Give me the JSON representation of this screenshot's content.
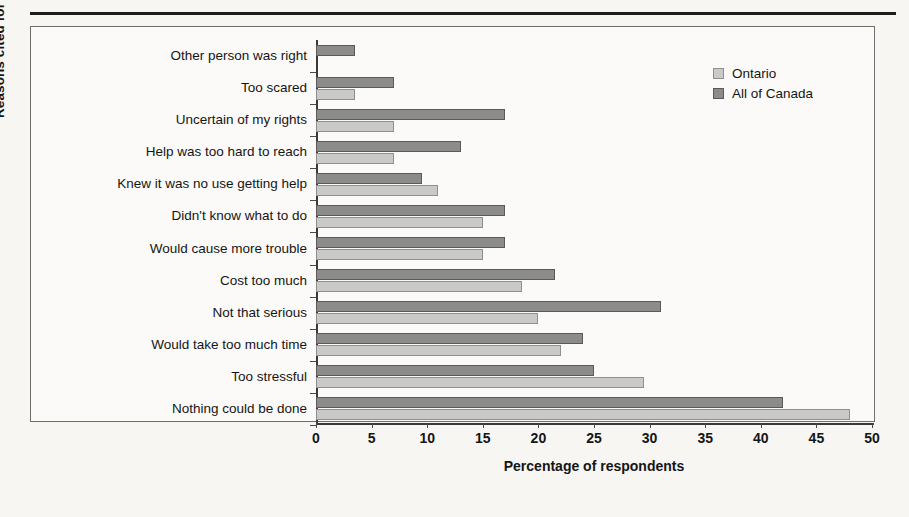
{
  "figure": {
    "y_axis_title": "Reasons cited for inaction",
    "x_axis_title": "Percentage of respondents"
  },
  "legend": {
    "position": "top-right",
    "entries": [
      {
        "label": "Ontario",
        "swatch": "light-gray-swatch-icon",
        "color": "#c9c9c7"
      },
      {
        "label": "All of Canada",
        "swatch": "dark-gray-swatch-icon",
        "color": "#8b8b8b"
      }
    ]
  },
  "chart_data": {
    "type": "bar",
    "orientation": "horizontal",
    "title": "",
    "xlabel": "Percentage of respondents",
    "ylabel": "Reasons cited for inaction",
    "xlim": [
      0,
      50
    ],
    "xticks": [
      0,
      5,
      10,
      15,
      20,
      25,
      30,
      35,
      40,
      45,
      50
    ],
    "xtick_labels": [
      "0",
      "5",
      "10",
      "15",
      "20",
      "25",
      "30",
      "35",
      "40",
      "45",
      "50"
    ],
    "grid": false,
    "legend_position": "top-right",
    "categories": [
      "Other person was right",
      "Too scared",
      "Uncertain of my rights",
      "Help was too hard to reach",
      "Knew it was no use getting help",
      "Didn't know what to do",
      "Would cause more trouble",
      "Cost too much",
      "Not that serious",
      "Would take too much time",
      "Too stressful",
      "Nothing could be done"
    ],
    "series": [
      {
        "name": "Ontario",
        "color": "#c9c9c7",
        "values": [
          0,
          3.5,
          7,
          7,
          11,
          15,
          15,
          18.5,
          20,
          22,
          29.5,
          48
        ]
      },
      {
        "name": "All of Canada",
        "color": "#8b8b8b",
        "values": [
          3.5,
          7,
          17,
          13,
          9.5,
          17,
          17,
          21.5,
          31,
          24,
          25,
          42
        ]
      }
    ]
  }
}
